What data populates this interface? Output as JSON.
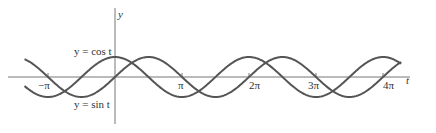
{
  "chart_data": {
    "type": "line",
    "title": "",
    "xlabel": "t",
    "ylabel": "y",
    "x_range": [
      -4.3,
      4.85
    ],
    "x_unit": "pi",
    "ylim": [
      -1,
      1
    ],
    "grid": false,
    "ticks": [
      {
        "value": -1,
        "label": "−π"
      },
      {
        "value": 1,
        "label": "π"
      },
      {
        "value": 2,
        "label": "2π"
      },
      {
        "value": 3,
        "label": "3π"
      },
      {
        "value": 4,
        "label": "4π"
      }
    ],
    "series": [
      {
        "name": "y = cos t",
        "function": "cos"
      },
      {
        "name": "y = sin t",
        "function": "sin"
      }
    ],
    "annotations": [
      {
        "text": "y = cos t",
        "near": "cos peak at t=0"
      },
      {
        "text": "y = sin t",
        "near": "below origin"
      }
    ],
    "color": "#555555"
  },
  "labels": {
    "y_axis": "y",
    "t_axis": "t",
    "cos_label": "y = cos t",
    "sin_label": "y = sin t",
    "tick_neg_pi": "−π",
    "tick_pi": "π",
    "tick_2pi": "2π",
    "tick_3pi": "3π",
    "tick_4pi": "4π"
  }
}
